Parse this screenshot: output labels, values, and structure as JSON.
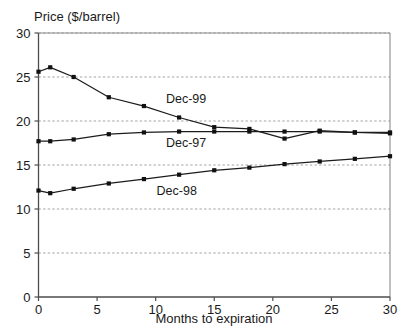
{
  "chart_data": {
    "type": "line",
    "title": "",
    "ylabel": "Price ($/barrel)",
    "xlabel": "Months to expiration",
    "xlim": [
      0,
      30
    ],
    "ylim": [
      0,
      30
    ],
    "xticks": [
      0,
      5,
      10,
      15,
      20,
      25,
      30
    ],
    "yticks": [
      0,
      5,
      10,
      15,
      20,
      25,
      30
    ],
    "xtick_labels": [
      "0",
      "5",
      "10",
      "15",
      "20",
      "25",
      "30"
    ],
    "ytick_labels": [
      "0",
      "5",
      "10",
      "15",
      "20",
      "25",
      "30"
    ],
    "grid": "horizontal-dashed",
    "legend_position": "inline-annotations",
    "x": [
      0,
      1,
      3,
      6,
      9,
      12,
      15,
      18,
      21,
      24,
      27,
      30
    ],
    "series": [
      {
        "name": "Dec-99",
        "values": [
          25.6,
          26.1,
          25.0,
          22.7,
          21.7,
          20.4,
          19.3,
          19.1,
          18.0,
          18.9,
          18.7,
          18.6
        ],
        "label_x": 12.6,
        "label_y": 22.1,
        "color": "#1c1c1c"
      },
      {
        "name": "Dec-97",
        "values": [
          17.7,
          17.7,
          17.9,
          18.5,
          18.7,
          18.8,
          18.8,
          18.8,
          18.8,
          18.8,
          18.7,
          18.7
        ],
        "label_x": 12.6,
        "label_y": 17.1,
        "color": "#1c1c1c"
      },
      {
        "name": "Dec-98",
        "values": [
          12.1,
          11.8,
          12.3,
          12.9,
          13.4,
          13.9,
          14.4,
          14.7,
          15.1,
          15.4,
          15.7,
          16.0
        ],
        "label_x": 11.8,
        "label_y": 11.6,
        "color": "#1c1c1c"
      }
    ]
  }
}
